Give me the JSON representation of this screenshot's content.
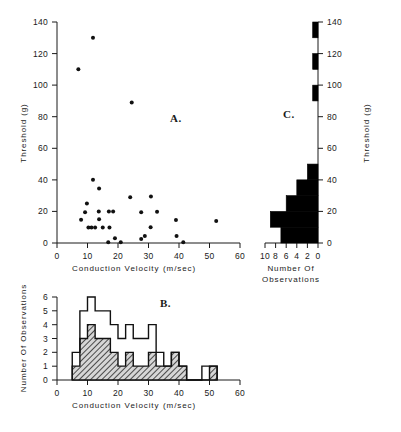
{
  "figure": {
    "title_panels": [
      "A.",
      "B.",
      "C."
    ],
    "background": "#ffffff",
    "ink_color": "#111111"
  },
  "panel_a": {
    "id_label": "A.",
    "xlabel": "Conduction  Velocity",
    "xunits": "(m/sec)",
    "ylabel": "Threshold  (g)",
    "xticks": [
      "0",
      "10",
      "20",
      "30",
      "40",
      "50",
      "60"
    ],
    "yticks": [
      "0",
      "20",
      "40",
      "60",
      "80",
      "100",
      "120",
      "140"
    ]
  },
  "panel_b": {
    "id_label": "B.",
    "xlabel": "Conduction  Velocity",
    "xunits": "(m/sec)",
    "ylabel": "Number Of Observations",
    "xticks": [
      "0",
      "10",
      "20",
      "30",
      "40",
      "50",
      "60"
    ],
    "yticks": [
      "0",
      "1",
      "2",
      "3",
      "4",
      "5",
      "6"
    ]
  },
  "panel_c": {
    "id_label": "C.",
    "xlabel_line1": "Number  Of",
    "xlabel_line2": "Observations",
    "ylabel": "Threshold  (g)",
    "xticks": [
      "10",
      "8",
      "6",
      "4",
      "2",
      "0"
    ],
    "yticks": [
      "0",
      "20",
      "40",
      "60",
      "80",
      "100",
      "120",
      "140"
    ]
  },
  "chart_data": [
    {
      "type": "scatter",
      "panel": "A",
      "title": "A.",
      "xlabel": "Conduction Velocity (m/sec)",
      "ylabel": "Threshold (g)",
      "xlim": [
        0,
        60
      ],
      "ylim": [
        0,
        140
      ],
      "xticks": [
        0,
        10,
        20,
        30,
        40,
        50,
        60
      ],
      "yticks": [
        0,
        20,
        40,
        60,
        80,
        100,
        120,
        140
      ],
      "grid": false,
      "legend": "none",
      "points": [
        {
          "x": 7.0,
          "y": 110
        },
        {
          "x": 11.8,
          "y": 130
        },
        {
          "x": 24.5,
          "y": 89
        },
        {
          "x": 11.8,
          "y": 40
        },
        {
          "x": 13.8,
          "y": 34.5
        },
        {
          "x": 24.0,
          "y": 29
        },
        {
          "x": 30.8,
          "y": 29.5
        },
        {
          "x": 9.8,
          "y": 25
        },
        {
          "x": 9.2,
          "y": 19.5
        },
        {
          "x": 13.7,
          "y": 20
        },
        {
          "x": 17.0,
          "y": 20
        },
        {
          "x": 18.4,
          "y": 20
        },
        {
          "x": 27.6,
          "y": 19.5
        },
        {
          "x": 32.8,
          "y": 19.8
        },
        {
          "x": 7.9,
          "y": 14.8
        },
        {
          "x": 13.8,
          "y": 15
        },
        {
          "x": 39.0,
          "y": 14.5
        },
        {
          "x": 52.2,
          "y": 14
        },
        {
          "x": 10.3,
          "y": 9.8
        },
        {
          "x": 11.3,
          "y": 9.8
        },
        {
          "x": 12.5,
          "y": 9.8
        },
        {
          "x": 15.0,
          "y": 9.8
        },
        {
          "x": 17.2,
          "y": 9.8
        },
        {
          "x": 30.7,
          "y": 10
        },
        {
          "x": 28.8,
          "y": 4.5
        },
        {
          "x": 39.2,
          "y": 4.5
        },
        {
          "x": 19.0,
          "y": 3.0
        },
        {
          "x": 27.6,
          "y": 2.5
        },
        {
          "x": 16.8,
          "y": 0.4
        },
        {
          "x": 20.9,
          "y": 0.4
        },
        {
          "x": 41.4,
          "y": 0.4
        }
      ]
    },
    {
      "type": "bar",
      "panel": "B",
      "title": "B.",
      "xlabel": "Conduction Velocity (m/sec)",
      "ylabel": "Number Of Observations",
      "xlim": [
        0,
        60
      ],
      "ylim": [
        0,
        6
      ],
      "bin_width": 2.5,
      "xticks": [
        0,
        10,
        20,
        30,
        40,
        50,
        60
      ],
      "yticks": [
        0,
        1,
        2,
        3,
        4,
        5,
        6
      ],
      "grid": false,
      "legend": "none",
      "series": [
        {
          "name": "All fibres (open outline)",
          "style": "outline",
          "bin_starts": [
            5.0,
            7.5,
            10.0,
            12.5,
            15.0,
            17.5,
            20.0,
            22.5,
            25.0,
            27.5,
            30.0,
            32.5,
            35.0,
            37.5,
            40.0,
            42.5,
            45.0,
            47.5,
            50.0
          ],
          "values": [
            2,
            5,
            6,
            5,
            5,
            4,
            3,
            4,
            3,
            3,
            4,
            2,
            1,
            2,
            1,
            0,
            0,
            1,
            1
          ]
        },
        {
          "name": "Sampled fibres (hatched)",
          "style": "hatched",
          "bin_starts": [
            5.0,
            7.5,
            10.0,
            12.5,
            15.0,
            17.5,
            20.0,
            22.5,
            25.0,
            27.5,
            30.0,
            32.5,
            35.0,
            37.5,
            40.0,
            42.5,
            45.0,
            47.5,
            50.0
          ],
          "values": [
            1,
            3,
            4,
            3,
            3,
            2,
            1,
            2,
            1,
            1,
            2,
            1,
            1,
            2,
            1,
            0,
            0,
            0,
            1
          ]
        }
      ]
    },
    {
      "type": "bar",
      "panel": "C",
      "orientation": "horizontal",
      "title": "C.",
      "xlabel": "Number Of Observations",
      "ylabel": "Threshold (g)",
      "xlim": [
        10,
        0
      ],
      "ylim": [
        0,
        140
      ],
      "x_reversed": true,
      "bin_width": 10,
      "xticks": [
        10,
        8,
        6,
        4,
        2,
        0
      ],
      "yticks": [
        0,
        20,
        40,
        60,
        80,
        100,
        120,
        140
      ],
      "grid": false,
      "legend": "none",
      "bin_starts": [
        0,
        10,
        20,
        30,
        40,
        50,
        60,
        70,
        80,
        90,
        100,
        110,
        120,
        130
      ],
      "values": [
        7,
        9,
        6,
        4,
        2,
        0,
        0,
        0,
        0,
        1,
        0,
        1,
        0,
        1
      ]
    }
  ]
}
